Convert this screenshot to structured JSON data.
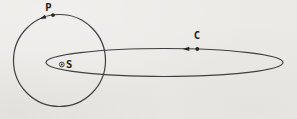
{
  "labels": {
    "planet": "P",
    "comet": "C",
    "sun": "S"
  },
  "icons": {
    "sun_symbol": "circled-dot",
    "planet_direction_arrow": "arrowhead-left",
    "comet_direction_arrow": "arrowhead-left"
  },
  "colors": {
    "background": "#eceae7",
    "orbit_line": "#3f3f3f",
    "marker": "#262626",
    "label_text": "#1f1f1f"
  }
}
